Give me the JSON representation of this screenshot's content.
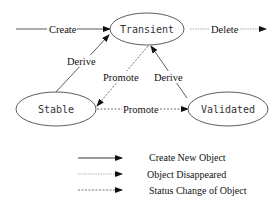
{
  "nodes": {
    "transient": "Transient",
    "stable": "Stable",
    "validated": "Validated"
  },
  "edges": {
    "create": "Create",
    "delete": "Delete",
    "derive_stable": "Derive",
    "promote_up": "Promote",
    "derive_validated": "Derive",
    "promote_horizontal": "Promote"
  },
  "legend": [
    {
      "style": "solid",
      "label": "Create New Object"
    },
    {
      "style": "light-dashed",
      "label": "Object Disappeared"
    },
    {
      "style": "dashed",
      "label": "Status Change of Object"
    }
  ]
}
